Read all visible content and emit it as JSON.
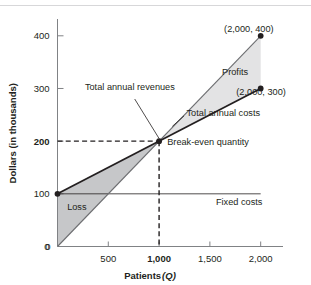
{
  "chart_data": {
    "type": "line",
    "title": "",
    "xlabel": "Patients (Q)",
    "xlabel_main": "Patients ",
    "xlabel_symbol": "(Q)",
    "ylabel": "Dollars (in thousands)",
    "xlim": [
      0,
      2200
    ],
    "ylim": [
      0,
      430
    ],
    "grid": false,
    "legend": "none",
    "x_ticks": [
      {
        "value": 0,
        "label": "0",
        "bold": false
      },
      {
        "value": 500,
        "label": "500",
        "bold": false
      },
      {
        "value": 1000,
        "label": "1,000",
        "bold": true
      },
      {
        "value": 1500,
        "label": "1,500",
        "bold": false
      },
      {
        "value": 2000,
        "label": "2,000",
        "bold": false
      }
    ],
    "y_ticks": [
      {
        "value": 0,
        "label": "0",
        "bold": false
      },
      {
        "value": 100,
        "label": "100",
        "bold": false
      },
      {
        "value": 200,
        "label": "200",
        "bold": true
      },
      {
        "value": 300,
        "label": "300",
        "bold": false
      },
      {
        "value": 400,
        "label": "400",
        "bold": false
      }
    ],
    "series": [
      {
        "name": "Total annual revenues",
        "x": [
          0,
          2000
        ],
        "values": [
          0,
          400
        ],
        "color": "#6d6e71",
        "width": 1.1
      },
      {
        "name": "Total annual costs",
        "x": [
          0,
          2000
        ],
        "values": [
          100,
          300
        ],
        "color": "#231f20",
        "width": 1.8
      },
      {
        "name": "Fixed costs",
        "x": [
          0,
          2000
        ],
        "values": [
          100,
          100
        ],
        "color": "#231f20",
        "width": 0.8
      }
    ],
    "regions": [
      {
        "name": "Loss",
        "color": "#c6c7c9",
        "x_range": [
          0,
          1000
        ]
      },
      {
        "name": "Profits",
        "color": "#e3e3e4",
        "x_range": [
          1000,
          2000
        ]
      }
    ],
    "points": [
      {
        "name": "fixed-cost-intercept",
        "x": 0,
        "y": 100
      },
      {
        "name": "break-even-point",
        "x": 1000,
        "y": 200
      },
      {
        "name": "revenue-endpoint",
        "x": 2000,
        "y": 400
      },
      {
        "name": "cost-endpoint",
        "x": 2000,
        "y": 300
      }
    ],
    "annotations": [
      {
        "name": "revenue-endpoint-label",
        "text": "(2,000, 400)",
        "x": 1640,
        "y": 408
      },
      {
        "name": "cost-endpoint-label",
        "text": "(2,000, 300)",
        "x": 1760,
        "y": 288
      },
      {
        "name": "profits-label",
        "text": "Profits",
        "x": 1620,
        "y": 325
      },
      {
        "name": "loss-label",
        "text": "Loss",
        "x": 95,
        "y": 70
      },
      {
        "name": "revenues-label",
        "text": "Total annual revenues",
        "x": 270,
        "y": 297
      },
      {
        "name": "costs-label",
        "text": "Total annual costs",
        "x": 1270,
        "y": 247
      },
      {
        "name": "breakeven-label",
        "text": "Break-even quantity",
        "x": 1080,
        "y": 192
      },
      {
        "name": "fixed-costs-label",
        "text": "Fixed costs",
        "x": 1560,
        "y": 78
      }
    ],
    "breakeven": {
      "x": 1000,
      "y": 200
    }
  }
}
